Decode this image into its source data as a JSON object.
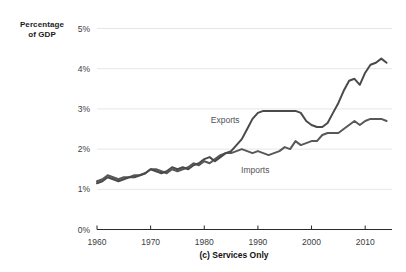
{
  "figure": {
    "axis_title_line1": "Percentage",
    "axis_title_line2": "of GDP",
    "caption": "(c) Services Only"
  },
  "chart_data": {
    "type": "line",
    "title": "",
    "xlabel": "",
    "ylabel": "Percentage of GDP",
    "caption": "(c) Services Only",
    "xlim": [
      1960,
      2015
    ],
    "ylim": [
      0,
      5
    ],
    "grid": "horizontal",
    "legend_position": "inline-labels",
    "x_ticks": [
      1960,
      1970,
      1980,
      1990,
      2000,
      2010
    ],
    "x_tick_labels": [
      "1960",
      "1970",
      "1980",
      "1990",
      "2000",
      "2010"
    ],
    "y_ticks": [
      0,
      1,
      2,
      3,
      4,
      5
    ],
    "y_tick_labels": [
      "0%",
      "1%",
      "2%",
      "3%",
      "4%",
      "5%"
    ],
    "colors": {
      "exports_line": "#4a4a4c",
      "imports_line": "#58585a",
      "grid_line": "#e6e6e6",
      "axis_line": "#2a2a2a",
      "tick_text": "#3c3c3e",
      "series_label_text": "#525254"
    },
    "x": [
      1960,
      1961,
      1962,
      1963,
      1964,
      1965,
      1966,
      1967,
      1968,
      1969,
      1970,
      1971,
      1972,
      1973,
      1974,
      1975,
      1976,
      1977,
      1978,
      1979,
      1980,
      1981,
      1982,
      1983,
      1984,
      1985,
      1986,
      1987,
      1988,
      1989,
      1990,
      1991,
      1992,
      1993,
      1994,
      1995,
      1996,
      1997,
      1998,
      1999,
      2000,
      2001,
      2002,
      2003,
      2004,
      2005,
      2006,
      2007,
      2008,
      2009,
      2010,
      2011,
      2012,
      2013,
      2014
    ],
    "series": [
      {
        "name": "Imports",
        "label": "Imports",
        "label_at": {
          "year": 1989.5,
          "pct": 1.47
        },
        "values": [
          1.2,
          1.25,
          1.35,
          1.3,
          1.25,
          1.3,
          1.3,
          1.35,
          1.35,
          1.4,
          1.5,
          1.5,
          1.45,
          1.4,
          1.5,
          1.45,
          1.5,
          1.55,
          1.65,
          1.6,
          1.7,
          1.65,
          1.75,
          1.85,
          1.9,
          1.9,
          1.95,
          2.0,
          1.95,
          1.9,
          1.95,
          1.9,
          1.85,
          1.9,
          1.95,
          2.05,
          2.0,
          2.2,
          2.1,
          2.15,
          2.2,
          2.2,
          2.35,
          2.4,
          2.4,
          2.4,
          2.5,
          2.6,
          2.7,
          2.6,
          2.7,
          2.75,
          2.75,
          2.75,
          2.7
        ]
      },
      {
        "name": "Exports",
        "label": "Exports",
        "label_at": {
          "year": 1983.9,
          "pct": 2.73
        },
        "values": [
          1.15,
          1.2,
          1.3,
          1.25,
          1.2,
          1.25,
          1.3,
          1.3,
          1.35,
          1.4,
          1.5,
          1.45,
          1.4,
          1.45,
          1.55,
          1.5,
          1.55,
          1.5,
          1.6,
          1.65,
          1.75,
          1.8,
          1.7,
          1.8,
          1.9,
          1.95,
          2.1,
          2.25,
          2.5,
          2.75,
          2.9,
          2.95,
          2.95,
          2.95,
          2.95,
          2.95,
          2.95,
          2.95,
          2.9,
          2.7,
          2.6,
          2.55,
          2.55,
          2.65,
          2.9,
          3.15,
          3.45,
          3.7,
          3.75,
          3.6,
          3.9,
          4.1,
          4.15,
          4.25,
          4.15
        ]
      }
    ]
  }
}
